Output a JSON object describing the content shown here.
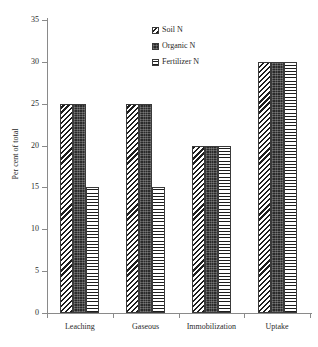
{
  "chart_data": {
    "type": "bar",
    "title": "",
    "xlabel": "",
    "ylabel": "Per cent of total",
    "categories": [
      "Leaching",
      "Gaseous",
      "Immobilization",
      "Uptake"
    ],
    "series": [
      {
        "name": "Soil N",
        "values": [
          25,
          25,
          20,
          30
        ],
        "pattern": "diagonal-hatch"
      },
      {
        "name": "Organic N",
        "values": [
          25,
          25,
          20,
          30
        ],
        "pattern": "dark-stipple"
      },
      {
        "name": "Fertilizer N",
        "values": [
          15,
          15,
          20,
          30
        ],
        "pattern": "cross-hatch-grid"
      }
    ],
    "ylim": [
      0,
      35
    ],
    "ytick_values": [
      0,
      5,
      10,
      15,
      20,
      25,
      30,
      35
    ],
    "ytick_labels": [
      "0",
      "5",
      "10",
      "15",
      "20",
      "25",
      "30",
      "35"
    ],
    "grid": false,
    "legend_position": "top-center",
    "colors": {
      "ink": "#1e1e1e",
      "axis": "#8a8a8a",
      "background": "#ffffff"
    }
  }
}
